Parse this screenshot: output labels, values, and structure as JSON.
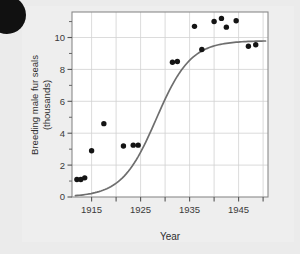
{
  "figure": {
    "name": "fur-seal-population-scatterplot",
    "background_color": "#ebebeb",
    "plot_background_color": "#ffffff",
    "frame_color": "#8a8a8a",
    "grid_color": "#d2d2d2",
    "point_color": "#141414",
    "curve_color": "#6e6e6e"
  },
  "corner_mark": {
    "shape": "filled-circle",
    "color": "#111111"
  },
  "chart_data": {
    "type": "scatter",
    "title": "",
    "subtitle": "",
    "xlabel": "Year",
    "ylabel": "Breeding male fur seals (thousands)",
    "ylabel_line1": "Breeding male fur seals",
    "ylabel_line2": "(thousands)",
    "xlim": [
      1911,
      1951
    ],
    "ylim": [
      0,
      11.6
    ],
    "grid": true,
    "legend": "none",
    "x_ticks_major": [
      1915,
      1925,
      1935,
      1945
    ],
    "x_tick_labels": [
      "1915",
      "1925",
      "1935",
      "1945"
    ],
    "x_gridlines": [
      1915,
      1920,
      1925,
      1930,
      1935,
      1940,
      1945,
      1950
    ],
    "y_ticks_major": [
      0,
      2,
      4,
      6,
      8,
      10
    ],
    "y_tick_labels": [
      "0",
      "2",
      "4",
      "6",
      "8",
      "10"
    ],
    "y_ticks_minor": [
      1,
      3,
      5,
      7,
      9,
      11
    ],
    "y_gridlines": [
      2,
      4,
      6,
      8,
      10
    ],
    "series": [
      {
        "name": "Breeding male fur seals",
        "type": "scatter",
        "marker": "filled-circle",
        "color": "#141414",
        "points": [
          {
            "x": 1912.0,
            "y": 1.1
          },
          {
            "x": 1912.8,
            "y": 1.1
          },
          {
            "x": 1913.6,
            "y": 1.2
          },
          {
            "x": 1915.0,
            "y": 2.9
          },
          {
            "x": 1917.5,
            "y": 4.6
          },
          {
            "x": 1921.5,
            "y": 3.2
          },
          {
            "x": 1923.5,
            "y": 3.25
          },
          {
            "x": 1924.5,
            "y": 3.25
          },
          {
            "x": 1931.5,
            "y": 8.45
          },
          {
            "x": 1932.5,
            "y": 8.5
          },
          {
            "x": 1936.0,
            "y": 10.7
          },
          {
            "x": 1937.5,
            "y": 9.25
          },
          {
            "x": 1940.0,
            "y": 11.0
          },
          {
            "x": 1941.5,
            "y": 11.2
          },
          {
            "x": 1942.5,
            "y": 10.65
          },
          {
            "x": 1944.5,
            "y": 11.05
          },
          {
            "x": 1947.0,
            "y": 9.45
          },
          {
            "x": 1948.5,
            "y": 9.55
          }
        ]
      },
      {
        "name": "Fitted logistic growth curve",
        "type": "line",
        "color": "#6e6e6e",
        "asymptote": 9.8,
        "description": "Smooth sigmoid rising from about 1.0 near 1912 to an upper plateau of about 9.8 after 1940"
      }
    ]
  }
}
